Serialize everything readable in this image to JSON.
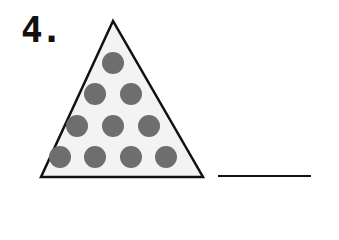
{
  "problem": {
    "number_label": "4.",
    "shape": "triangle",
    "dot_rows": [
      1,
      2,
      3,
      4
    ],
    "dot_count": 10,
    "answer": "",
    "colors": {
      "triangle_fill": "#f3f3f3",
      "triangle_stroke": "#111111",
      "dot_fill": "#6e6e6e",
      "line": "#111111"
    }
  }
}
